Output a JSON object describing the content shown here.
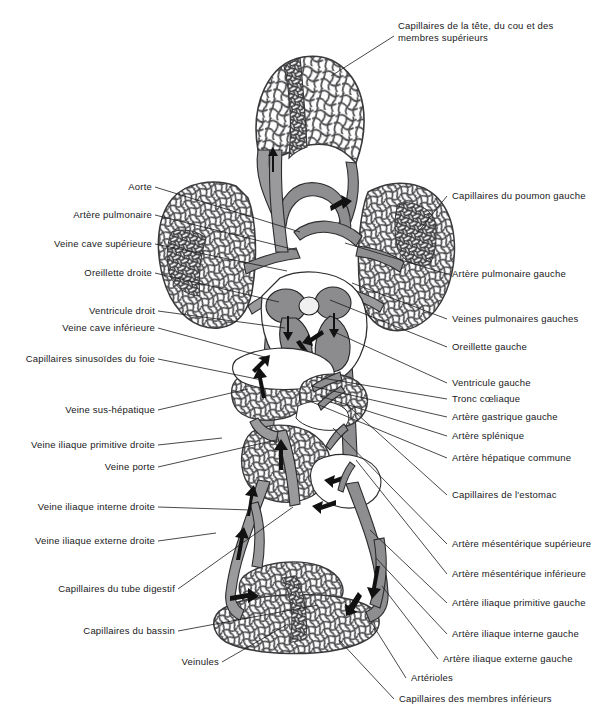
{
  "figure": {
    "language": "fr",
    "colors": {
      "background": "#ffffff",
      "vessel_fill": "#9a9a9d",
      "vessel_stroke": "#2c2c2e",
      "capillary_network": "#4a4a4d",
      "dense_capillary": "#3a3a3d",
      "label_text": "#18181a",
      "leader_line": "#1a1a1c"
    }
  },
  "labels_left": [
    {
      "id": "aorte",
      "text": "Aorte",
      "x": 122,
      "y": 182,
      "tx": 155,
      "ty": 187,
      "ex": 300,
      "ey": 232
    },
    {
      "id": "artere-pulmonaire",
      "text": "Artère pulmonaire",
      "x": 69,
      "y": 210,
      "tx": 155,
      "ty": 215,
      "ex": 296,
      "ey": 250
    },
    {
      "id": "veine-cave-superieure",
      "text": "Veine cave supérieure",
      "x": 51,
      "y": 239,
      "tx": 155,
      "ty": 244,
      "ex": 287,
      "ey": 271
    },
    {
      "id": "oreillette-droite",
      "text": "Oreillette droite",
      "x": 83,
      "y": 268,
      "tx": 155,
      "ty": 273,
      "ex": 279,
      "ey": 302
    },
    {
      "id": "ventricule-droit",
      "text": "Ventricule droit",
      "x": 84,
      "y": 306,
      "tx": 158,
      "ty": 311,
      "ex": 285,
      "ey": 328
    },
    {
      "id": "veine-cave-inferieure",
      "text": "Veine cave inférieure",
      "x": 57,
      "y": 323,
      "tx": 158,
      "ty": 328,
      "ex": 268,
      "ey": 358
    },
    {
      "id": "capillaires-sinusoides",
      "text": "Capillaires sinusoïdes du foie",
      "x": 22,
      "y": 355,
      "tx": 158,
      "ty": 359,
      "ex": 262,
      "ey": 380
    },
    {
      "id": "veine-sus-hepatique",
      "text": "Veine sus-hépatique",
      "x": 62,
      "y": 406,
      "tx": 158,
      "ty": 410,
      "ex": 248,
      "ey": 389
    },
    {
      "id": "veine-iliaque-prim-droite",
      "text": "Veine iliaque primitive droite",
      "x": 26,
      "y": 441,
      "tx": 158,
      "ty": 445,
      "ex": 222,
      "ey": 438
    },
    {
      "id": "veine-porte",
      "text": "Veine porte",
      "x": 99,
      "y": 463,
      "tx": 158,
      "ty": 467,
      "ex": 276,
      "ey": 440
    },
    {
      "id": "veine-iliaque-int-droite",
      "text": "Veine iliaque interne droite",
      "x": 33,
      "y": 503,
      "tx": 158,
      "ty": 507,
      "ex": 251,
      "ey": 510
    },
    {
      "id": "veine-iliaque-ext-droite",
      "text": "Veine iliaque externe droite",
      "x": 30,
      "y": 537,
      "tx": 158,
      "ty": 541,
      "ex": 216,
      "ey": 533
    },
    {
      "id": "capillaires-tube-digestif",
      "text": "Capillaires du tube digestif",
      "x": 51,
      "y": 592,
      "tx": 178,
      "ty": 589,
      "ex": 293,
      "ey": 507
    },
    {
      "id": "capillaires-bassin",
      "text": "Capillaires du bassin",
      "x": 77,
      "y": 633,
      "tx": 178,
      "ty": 631,
      "ex": 318,
      "ey": 605
    },
    {
      "id": "veinules",
      "text": "Veinules",
      "x": 175,
      "y": 665,
      "tx": 222,
      "ty": 662,
      "ex": 288,
      "ey": 624
    }
  ],
  "labels_right": [
    {
      "id": "capillaires-poumon-gauche",
      "text": "Capillaires du poumon gauche",
      "x": 450,
      "y": 193,
      "tx": 447,
      "ty": 196,
      "ex": 418,
      "ey": 232
    },
    {
      "id": "artere-pulmonaire-gauche",
      "text": "Artère pulmonaire gauche",
      "x": 450,
      "y": 272,
      "tx": 447,
      "ty": 274,
      "ex": 345,
      "ey": 243
    },
    {
      "id": "veines-pulmonaires-g",
      "text": "Veines pulmonaires gauches",
      "x": 450,
      "y": 318,
      "tx": 447,
      "ty": 319,
      "ex": 352,
      "ey": 283
    },
    {
      "id": "oreillette-gauche",
      "text": "Oreillette gauche",
      "x": 450,
      "y": 346,
      "tx": 447,
      "ty": 347,
      "ex": 330,
      "ey": 300
    },
    {
      "id": "ventricule-gauche",
      "text": "Ventricule gauche",
      "x": 450,
      "y": 382,
      "tx": 447,
      "ty": 383,
      "ex": 330,
      "ey": 330
    },
    {
      "id": "tronc-coeliaque",
      "text": "Tronc cœliaque",
      "x": 450,
      "y": 398,
      "tx": 447,
      "ty": 399,
      "ex": 316,
      "ey": 377
    },
    {
      "id": "artere-gastrique-gauche",
      "text": "Artère gastrique gauche",
      "x": 450,
      "y": 415,
      "tx": 447,
      "ty": 417,
      "ex": 311,
      "ey": 386
    },
    {
      "id": "artere-splenique",
      "text": "Artère splénique",
      "x": 450,
      "y": 434,
      "tx": 447,
      "ty": 436,
      "ex": 320,
      "ey": 396
    },
    {
      "id": "artere-hepatique-commune",
      "text": "Artère hépatique commune",
      "x": 450,
      "y": 456,
      "tx": 447,
      "ty": 458,
      "ex": 307,
      "ey": 400
    },
    {
      "id": "capillaires-estomac",
      "text": "Capillaires de l'estomac",
      "x": 450,
      "y": 494,
      "tx": 447,
      "ty": 495,
      "ex": 346,
      "ey": 404
    },
    {
      "id": "artere-mesenterique-sup",
      "text": "Artère mésentérique supérieure",
      "x": 450,
      "y": 543,
      "tx": 447,
      "ty": 544,
      "ex": 333,
      "ey": 428
    },
    {
      "id": "artere-mesenterique-inf",
      "text": "Artère mésentérique inférieure",
      "x": 450,
      "y": 573,
      "tx": 447,
      "ty": 574,
      "ex": 356,
      "ey": 460
    },
    {
      "id": "artere-iliaque-prim-g",
      "text": "Artère iliaque primitive gauche",
      "x": 450,
      "y": 602,
      "tx": 447,
      "ty": 603,
      "ex": 370,
      "ey": 530
    },
    {
      "id": "artere-iliaque-int-g",
      "text": "Artère iliaque interne gauche",
      "x": 450,
      "y": 633,
      "tx": 447,
      "ty": 634,
      "ex": 376,
      "ey": 558
    },
    {
      "id": "artere-iliaque-ext-g",
      "text": "Artère iliaque externe gauche",
      "x": 441,
      "y": 658,
      "tx": 438,
      "ty": 659,
      "ex": 382,
      "ey": 586
    },
    {
      "id": "arterioles",
      "text": "Artérioles",
      "x": 409,
      "y": 677,
      "tx": 406,
      "ty": 678,
      "ex": 371,
      "ey": 622
    },
    {
      "id": "capillaires-membres-inf",
      "text": "Capillaires des membres inférieurs",
      "x": 397,
      "y": 698,
      "tx": 394,
      "ty": 699,
      "ex": 339,
      "ey": 640
    }
  ],
  "labels_top": [
    {
      "id": "capillaires-tete-cou",
      "line1": "Capillaires de la tête, du cou et des",
      "line2": "membres supérieurs",
      "x": 398,
      "y": 27,
      "tx": 394,
      "ty": 36,
      "ex": 331,
      "ey": 76
    }
  ]
}
